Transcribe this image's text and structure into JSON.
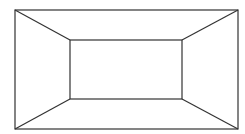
{
  "diagram": {
    "stroke_color": "#333333",
    "background": "#ffffff",
    "outer_rect": {
      "x1": 15,
      "y1": 10,
      "x2": 238,
      "y2": 129
    },
    "inner_rect": {
      "x1": 70,
      "y1": 40,
      "x2": 182,
      "y2": 99
    },
    "connectors": [
      {
        "from": [
          15,
          10
        ],
        "to": [
          70,
          40
        ]
      },
      {
        "from": [
          238,
          10
        ],
        "to": [
          182,
          40
        ]
      },
      {
        "from": [
          15,
          129
        ],
        "to": [
          70,
          99
        ]
      },
      {
        "from": [
          238,
          129
        ],
        "to": [
          182,
          99
        ]
      }
    ]
  }
}
